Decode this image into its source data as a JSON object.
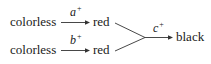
{
  "diagram": {
    "type": "reaction-pathway",
    "nodes": {
      "start1": "colorless",
      "start2": "colorless",
      "mid1": "red",
      "mid2": "red",
      "end": "black"
    },
    "edges": [
      {
        "from": "start1",
        "to": "mid1",
        "label": "a",
        "sup": "+"
      },
      {
        "from": "start2",
        "to": "mid2",
        "label": "b",
        "sup": "+"
      },
      {
        "from": "mid1+mid2",
        "to": "end",
        "label": "c",
        "sup": "+"
      }
    ],
    "colors": {
      "text": "#1a1a1a",
      "lines": "#333333",
      "background": "#ffffff"
    }
  }
}
